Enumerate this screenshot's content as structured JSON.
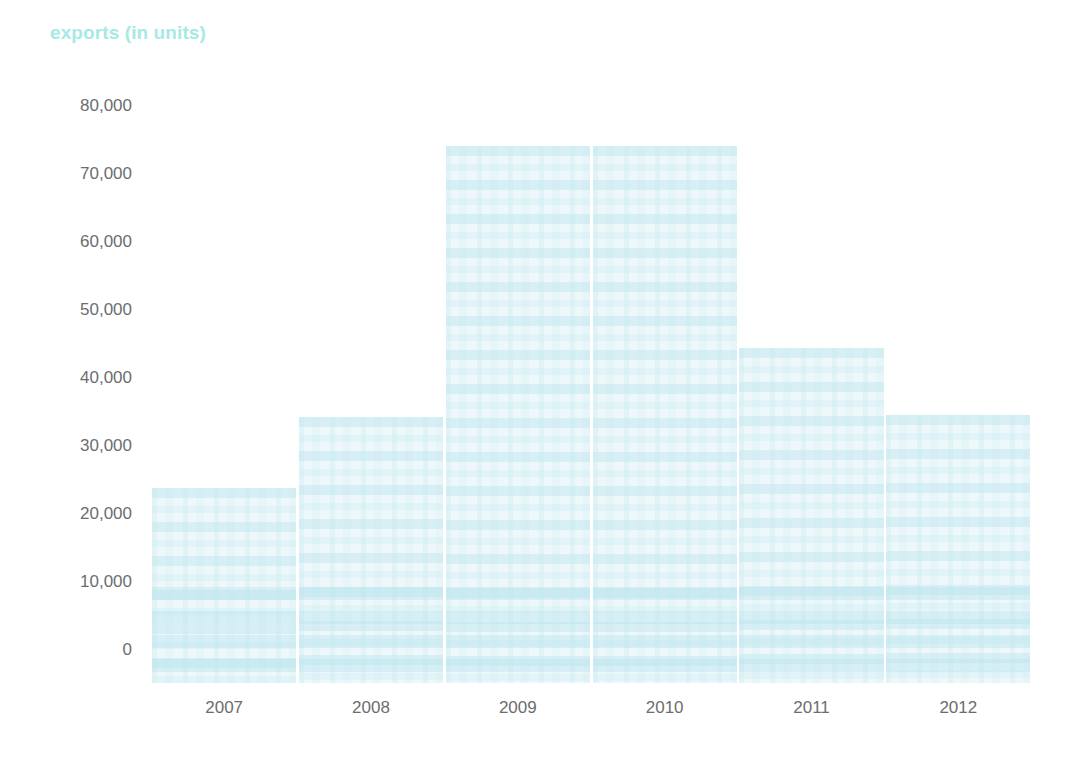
{
  "chart_data": {
    "type": "bar",
    "title": "exports (in units)",
    "xlabel": "",
    "ylabel": "",
    "categories": [
      "2007",
      "2008",
      "2009",
      "2010",
      "2011",
      "2012"
    ],
    "values": [
      23800,
      34300,
      74100,
      74100,
      44400,
      34600
    ],
    "ylim": [
      0,
      80000
    ],
    "yticks": [
      0,
      10000,
      20000,
      30000,
      40000,
      50000,
      60000,
      70000,
      80000
    ],
    "ytick_labels": [
      "0",
      "10,000",
      "20,000",
      "30,000",
      "40,000",
      "50,000",
      "60,000",
      "70,000",
      "80,000"
    ],
    "grid": false,
    "legend": null,
    "series": [
      {
        "name": "exports",
        "values": [
          23800,
          34300,
          74100,
          74100,
          44400,
          34600
        ]
      }
    ],
    "colors": {
      "bar_fill": "#eef8fa",
      "bar_texture": "#c4e8f0",
      "title": "#a6e9e6",
      "tick_label": "#6d6d6d",
      "background": "#ffffff"
    }
  }
}
